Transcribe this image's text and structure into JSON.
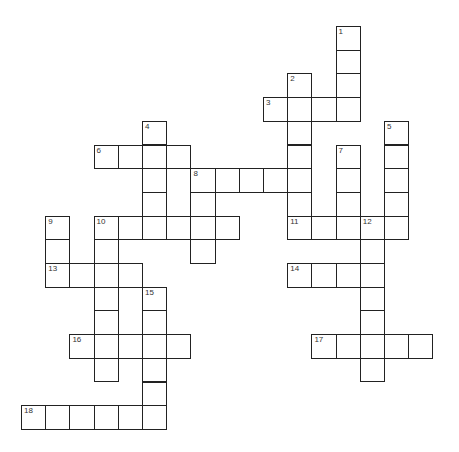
{
  "puzzle": {
    "type": "crossword",
    "grid": {
      "origin_x": 21,
      "origin_y": 26,
      "cell_w": 24.2,
      "cell_h": 23.7
    },
    "colors": {
      "border": "#222222",
      "cell_bg": "#ffffff",
      "number": "#333333"
    },
    "entries": [
      {
        "number": "1",
        "direction": "down",
        "col": 13,
        "row": 0,
        "length": 4
      },
      {
        "number": "2",
        "direction": "down",
        "col": 11,
        "row": 2,
        "length": 7
      },
      {
        "number": "3",
        "direction": "across",
        "col": 10,
        "row": 3,
        "length": 4
      },
      {
        "number": "4",
        "direction": "down",
        "col": 5,
        "row": 4,
        "length": 5
      },
      {
        "number": "5",
        "direction": "down",
        "col": 15,
        "row": 4,
        "length": 5
      },
      {
        "number": "6",
        "direction": "across",
        "col": 3,
        "row": 5,
        "length": 4
      },
      {
        "number": "7",
        "direction": "down",
        "col": 13,
        "row": 5,
        "length": 4
      },
      {
        "number": "8",
        "direction": "across",
        "col": 7,
        "row": 6,
        "length": 5
      },
      {
        "number": "8",
        "direction": "down",
        "col": 7,
        "row": 6,
        "length": 4
      },
      {
        "number": "9",
        "direction": "down",
        "col": 1,
        "row": 8,
        "length": 3
      },
      {
        "number": "10",
        "direction": "across",
        "col": 3,
        "row": 8,
        "length": 6
      },
      {
        "number": "10",
        "direction": "down",
        "col": 3,
        "row": 8,
        "length": 7
      },
      {
        "number": "11",
        "direction": "across",
        "col": 11,
        "row": 8,
        "length": 5
      },
      {
        "number": "12",
        "direction": "down",
        "col": 14,
        "row": 8,
        "length": 7
      },
      {
        "number": "13",
        "direction": "across",
        "col": 1,
        "row": 10,
        "length": 4
      },
      {
        "number": "14",
        "direction": "across",
        "col": 11,
        "row": 10,
        "length": 4
      },
      {
        "number": "15",
        "direction": "down",
        "col": 5,
        "row": 11,
        "length": 6
      },
      {
        "number": "16",
        "direction": "across",
        "col": 2,
        "row": 13,
        "length": 5
      },
      {
        "number": "17",
        "direction": "across",
        "col": 12,
        "row": 13,
        "length": 5
      },
      {
        "number": "18",
        "direction": "across",
        "col": 0,
        "row": 16,
        "length": 6
      }
    ]
  }
}
